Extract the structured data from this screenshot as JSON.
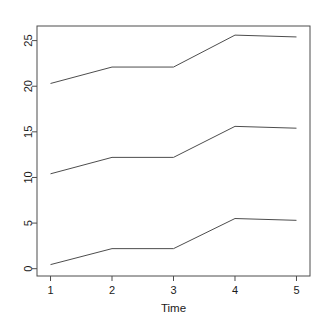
{
  "chart_data": {
    "type": "line",
    "title": "",
    "subtitle": "",
    "xlabel": "Time",
    "ylabel": "",
    "x": [
      1,
      2,
      3,
      4,
      5
    ],
    "xtick_labels": [
      "1",
      "2",
      "3",
      "4",
      "5"
    ],
    "ytick_values": [
      0,
      5,
      10,
      15,
      20,
      25
    ],
    "ytick_labels": [
      "0",
      "5",
      "10",
      "15",
      "20",
      "25"
    ],
    "xlim": [
      0.78,
      5.22
    ],
    "ylim": [
      -0.8,
      26.6
    ],
    "grid": false,
    "legend": false,
    "legend_position": "none",
    "line_color": "#4d4d4d",
    "axis_color": "#4d4d4d",
    "background": "#ffffff",
    "series": [
      {
        "name": "upper",
        "values": [
          20.3,
          22.1,
          22.1,
          25.6,
          25.4
        ]
      },
      {
        "name": "middle",
        "values": [
          10.4,
          12.2,
          12.2,
          15.6,
          15.4
        ]
      },
      {
        "name": "lower",
        "values": [
          0.45,
          2.2,
          2.2,
          5.5,
          5.3
        ]
      }
    ]
  },
  "axes": {
    "x_axis_title": "Time",
    "y_axis_title": ""
  }
}
